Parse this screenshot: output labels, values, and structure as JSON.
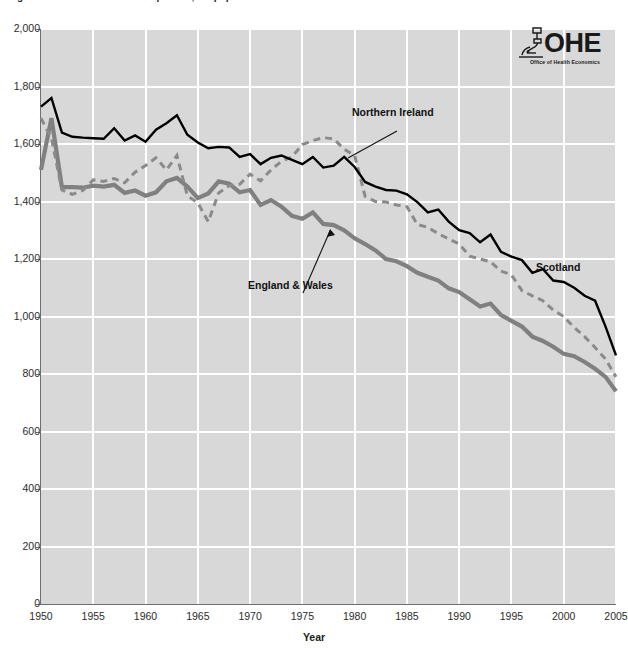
{
  "header": {
    "title_clipped": "Figure: Deaths from all causes per 100,000 population",
    "logo": {
      "wordmark": "OHE",
      "subtitle": "Office of Health Economics",
      "mark_icon": "microscope-icon"
    }
  },
  "axis_title": {
    "x": "Year"
  },
  "colors": {
    "plot_background": "#d8d8d8",
    "gridline": "#ffffff",
    "axis": "#6f6f6f",
    "scotland": "#000000",
    "england_wales": "#808080",
    "northern_ireland": "#8a8a8a",
    "text": "#1c1c1c"
  },
  "chart_data": {
    "type": "line",
    "title": "Figure: Deaths from all causes per 100,000 population",
    "xlabel": "Year",
    "ylabel": "",
    "xlim": [
      1950,
      2005
    ],
    "ylim": [
      0,
      2000
    ],
    "grid": true,
    "legend_position": "inline-annotations",
    "xticks": [
      1950,
      1955,
      1960,
      1965,
      1970,
      1975,
      1980,
      1985,
      1990,
      1995,
      2000,
      2005
    ],
    "xtick_labels": [
      "1950",
      "1955",
      "1960",
      "1965",
      "1970",
      "1975",
      "1980",
      "1985",
      "1990",
      "1995",
      "2000",
      "2005"
    ],
    "yticks": [
      0,
      200,
      400,
      600,
      800,
      1000,
      1200,
      1400,
      1600,
      1800,
      2000
    ],
    "ytick_labels": [
      "0",
      "200",
      "400",
      "600",
      "800",
      "1,000",
      "1,200",
      "1,400",
      "1,600",
      "1,800",
      "2,000"
    ],
    "x": [
      1950,
      1951,
      1952,
      1953,
      1954,
      1955,
      1956,
      1957,
      1958,
      1959,
      1960,
      1961,
      1962,
      1963,
      1964,
      1965,
      1966,
      1967,
      1968,
      1969,
      1970,
      1971,
      1972,
      1973,
      1974,
      1975,
      1976,
      1977,
      1978,
      1979,
      1980,
      1981,
      1982,
      1983,
      1984,
      1985,
      1986,
      1987,
      1988,
      1989,
      1990,
      1991,
      1992,
      1993,
      1994,
      1995,
      1996,
      1997,
      1998,
      1999,
      2000,
      2001,
      2002,
      2003,
      2004,
      2005
    ],
    "series": [
      {
        "name": "Scotland",
        "style": "solid",
        "color": "#000000",
        "width": 2.4,
        "values": [
          1730,
          1760,
          1640,
          1625,
          1622,
          1620,
          1618,
          1655,
          1612,
          1630,
          1608,
          1650,
          1672,
          1700,
          1632,
          1605,
          1585,
          1590,
          1588,
          1555,
          1565,
          1530,
          1552,
          1560,
          1545,
          1530,
          1555,
          1518,
          1525,
          1555,
          1520,
          1468,
          1452,
          1440,
          1438,
          1425,
          1398,
          1362,
          1372,
          1330,
          1300,
          1290,
          1258,
          1285,
          1225,
          1208,
          1196,
          1152,
          1165,
          1125,
          1120,
          1100,
          1072,
          1055,
          965,
          865
        ]
      },
      {
        "name": "Northern Ireland",
        "style": "dashed",
        "color": "#8a8a8a",
        "width": 3.0,
        "values": [
          1690,
          1620,
          1440,
          1425,
          1438,
          1475,
          1470,
          1480,
          1465,
          1502,
          1525,
          1552,
          1510,
          1560,
          1420,
          1395,
          1330,
          1430,
          1455,
          1460,
          1495,
          1472,
          1510,
          1540,
          1555,
          1598,
          1612,
          1622,
          1618,
          1582,
          1560,
          1418,
          1400,
          1398,
          1388,
          1382,
          1320,
          1310,
          1288,
          1270,
          1252,
          1210,
          1200,
          1190,
          1158,
          1145,
          1090,
          1072,
          1055,
          1022,
          1000,
          962,
          930,
          892,
          852,
          790
        ]
      },
      {
        "name": "England & Wales",
        "style": "solid",
        "color": "#808080",
        "width": 4.2,
        "values": [
          1510,
          1690,
          1450,
          1450,
          1448,
          1455,
          1452,
          1458,
          1430,
          1438,
          1420,
          1432,
          1470,
          1482,
          1452,
          1412,
          1428,
          1470,
          1462,
          1432,
          1440,
          1388,
          1405,
          1382,
          1350,
          1340,
          1362,
          1322,
          1318,
          1300,
          1272,
          1252,
          1230,
          1200,
          1192,
          1175,
          1152,
          1138,
          1125,
          1098,
          1085,
          1060,
          1035,
          1045,
          1005,
          985,
          965,
          930,
          915,
          895,
          870,
          862,
          842,
          818,
          790,
          740
        ]
      }
    ]
  }
}
